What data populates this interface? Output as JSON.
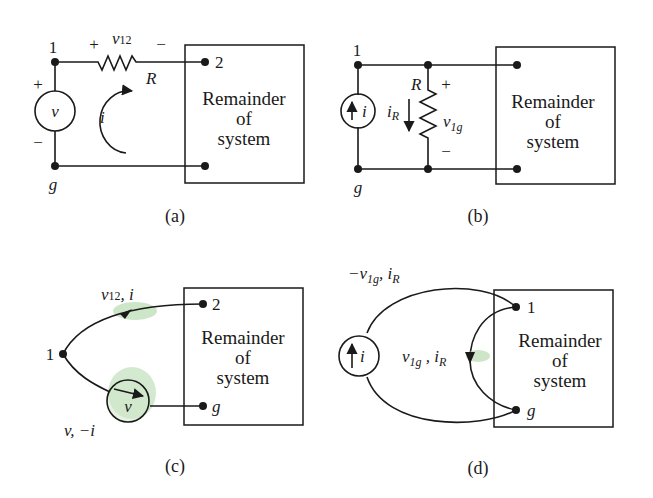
{
  "figure": {
    "panels": [
      {
        "id": "a",
        "caption": "(a)",
        "box_label": [
          "Remainder",
          "of",
          "system"
        ],
        "nodes": {
          "n1": "1",
          "n2": "2",
          "ng": "g"
        },
        "source": {
          "type": "voltage",
          "symbol": "v",
          "plus": "+",
          "minus": "−"
        },
        "resistor": {
          "label": "R",
          "voltage_label": "v",
          "voltage_sub": "12",
          "plus": "+",
          "minus": "−"
        },
        "loop_current": "i"
      },
      {
        "id": "b",
        "caption": "(b)",
        "box_label": [
          "Remainder",
          "of",
          "system"
        ],
        "nodes": {
          "n1": "1",
          "ng": "g"
        },
        "source": {
          "type": "current",
          "symbol": "i"
        },
        "resistor": {
          "label": "R",
          "current_label": "i",
          "current_sub": "R",
          "voltage_label": "v",
          "voltage_sub": "1g",
          "plus": "+",
          "minus": "−"
        }
      },
      {
        "id": "c",
        "caption": "(c)",
        "box_label": [
          "Remainder",
          "of",
          "system"
        ],
        "nodes": {
          "n1": "1",
          "n2": "2",
          "ng": "g"
        },
        "edge_top": {
          "label": "v",
          "sub": "12",
          "rest": ", i"
        },
        "edge_bottom": {
          "label": "v, −i"
        },
        "source_symbol": "v"
      },
      {
        "id": "d",
        "caption": "(d)",
        "box_label": [
          "Remainder",
          "of",
          "system"
        ],
        "nodes": {
          "n1": "1",
          "ng": "g"
        },
        "edge_outer": {
          "prefix": "−v",
          "sub": "1g",
          "rest": ", i",
          "rest_sub": "R"
        },
        "edge_inner": {
          "prefix": "v",
          "sub": "1g",
          "rest": " , i",
          "rest_sub": "R"
        },
        "source_symbol": "i"
      }
    ]
  }
}
